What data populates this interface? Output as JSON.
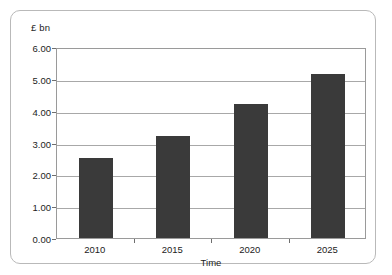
{
  "chart_data": {
    "type": "bar",
    "title": "",
    "subtitle": "",
    "categories": [
      "2010",
      "2015",
      "2020",
      "2025"
    ],
    "values": [
      2.5,
      3.2,
      4.2,
      5.15
    ],
    "xlabel": "Time",
    "ylabel": "£ bn",
    "ylim": [
      0.0,
      6.0
    ],
    "ytick_step": 1.0,
    "ytick_labels": [
      "0.00",
      "1.00",
      "2.00",
      "3.00",
      "4.00",
      "5.00",
      "6.00"
    ],
    "ytick_values": [
      0.0,
      1.0,
      2.0,
      3.0,
      4.0,
      5.0,
      6.0
    ],
    "grid": true,
    "grid_axis": "y",
    "legend": false,
    "legend_position": "none",
    "bar_color": "#3a3a3a",
    "plot_background": "#ffffff",
    "gridline_color": "#a8a8a8",
    "axis_color": "#9a9a9a",
    "frame_color": "#b9b9b9"
  }
}
